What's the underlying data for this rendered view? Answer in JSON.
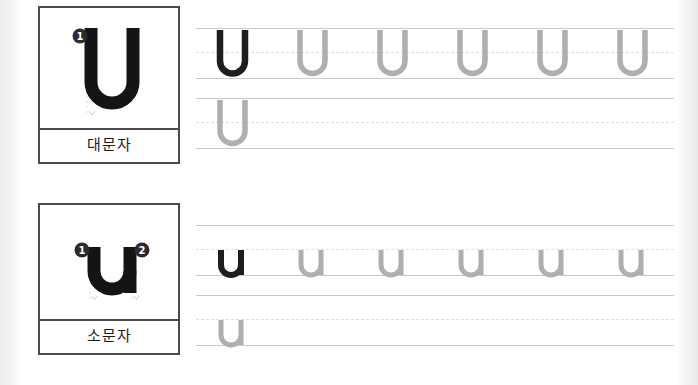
{
  "worksheet": {
    "letter_upper": "U",
    "letter_lower": "u",
    "background_color": "#ffffff",
    "margin_color": "#ececed"
  },
  "colors": {
    "model_glyph": "#141416",
    "traced_glyph": "#1e1e20",
    "ghost_glyph": "#adafb2",
    "rule_solid": "#c9cacc",
    "rule_dashed": "#dddee0",
    "card_border": "#4b4b4f",
    "marker_fill": "#2b2b2e",
    "marker_text": "#ffffff",
    "guide_dotted": "#d8d9db"
  },
  "sections": [
    {
      "id": "upper",
      "card": {
        "letter": "U",
        "label": "대문자",
        "stroke_markers": [
          {
            "number": "1",
            "x": 32,
            "y": 32
          }
        ]
      },
      "rows": [
        {
          "id": "upper-row-1",
          "lines": {
            "top": 0,
            "mid": 24,
            "base": 50
          },
          "letters": [
            {
              "char": "U",
              "style": "traced"
            },
            {
              "char": "U",
              "style": "ghost"
            },
            {
              "char": "U",
              "style": "ghost"
            },
            {
              "char": "U",
              "style": "ghost"
            },
            {
              "char": "U",
              "style": "ghost"
            },
            {
              "char": "U",
              "style": "ghost"
            }
          ]
        },
        {
          "id": "upper-row-2",
          "lines": {
            "top": 0,
            "mid": 24,
            "base": 50
          },
          "letters": [
            {
              "char": "U",
              "style": "ghost"
            }
          ]
        }
      ]
    },
    {
      "id": "lower",
      "card": {
        "letter": "u",
        "label": "소문자",
        "stroke_markers": [
          {
            "number": "1",
            "x": 28,
            "y": 38
          },
          {
            "number": "2",
            "x": 86,
            "y": 38
          }
        ]
      },
      "rows": [
        {
          "id": "lower-row-1",
          "lines": {
            "top": 0,
            "mid": 24,
            "base": 50
          },
          "letters": [
            {
              "char": "u",
              "style": "traced"
            },
            {
              "char": "u",
              "style": "ghost"
            },
            {
              "char": "u",
              "style": "ghost"
            },
            {
              "char": "u",
              "style": "ghost"
            },
            {
              "char": "u",
              "style": "ghost"
            },
            {
              "char": "u",
              "style": "ghost"
            }
          ]
        },
        {
          "id": "lower-row-2",
          "lines": {
            "top": 0,
            "mid": 24,
            "base": 50
          },
          "letters": [
            {
              "char": "u",
              "style": "ghost"
            }
          ]
        }
      ]
    }
  ],
  "layout": {
    "row_y": {
      "upper_1": 28,
      "upper_2": 98,
      "lower_1": 32,
      "lower_2": 102
    },
    "letter_spacing": 80,
    "first_letter_x": 16
  }
}
